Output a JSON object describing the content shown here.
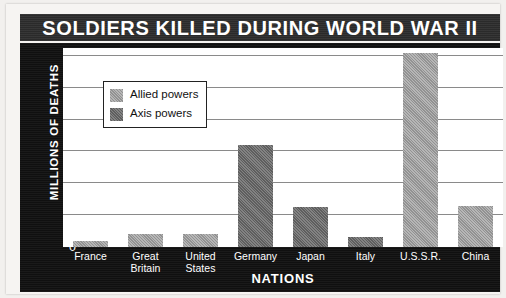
{
  "chart_data": {
    "type": "bar",
    "title": "SOLDIERS KILLED DURING WORLD WAR II",
    "xlabel": "NATIONS",
    "ylabel": "MILLIONS OF DEATHS",
    "categories": [
      "France",
      "Great Britain",
      "United States",
      "Germany",
      "Japan",
      "Italy",
      "U.S.S.R.",
      "China"
    ],
    "values": [
      0.2,
      0.4,
      0.4,
      3.2,
      1.25,
      0.33,
      6.1,
      1.3
    ],
    "groups": [
      "Allied powers",
      "Allied powers",
      "Allied powers",
      "Axis powers",
      "Axis powers",
      "Axis powers",
      "Allied powers",
      "Allied powers"
    ],
    "series": [
      {
        "name": "Allied powers",
        "color": "#9e9e9e",
        "points": [
          {
            "category": "France",
            "value": 0.2
          },
          {
            "category": "Great Britain",
            "value": 0.4
          },
          {
            "category": "United States",
            "value": 0.4
          },
          {
            "category": "U.S.S.R.",
            "value": 6.1
          },
          {
            "category": "China",
            "value": 1.3
          }
        ]
      },
      {
        "name": "Axis powers",
        "color": "#6b6b6b",
        "points": [
          {
            "category": "Germany",
            "value": 3.2
          },
          {
            "category": "Japan",
            "value": 1.25
          },
          {
            "category": "Italy",
            "value": 0.33
          }
        ]
      }
    ],
    "ylim": [
      0,
      6.25
    ],
    "yticks": [
      0,
      1,
      2,
      3,
      4,
      5,
      6
    ],
    "ytick_labels": [
      "0",
      "1",
      "2",
      "3",
      "4",
      "5",
      "6"
    ],
    "grid": true,
    "legend_position": "upper-left-inside"
  },
  "legend": {
    "entries": [
      {
        "label": "Allied powers",
        "swatch": "allied",
        "color": "#9e9e9e"
      },
      {
        "label": "Axis powers",
        "swatch": "axis",
        "color": "#6b6b6b"
      }
    ]
  },
  "colors": {
    "title_bar_background": "#2c2c2c",
    "title_text": "#ffffff",
    "frame_background": "#111111",
    "plot_background": "#ffffff",
    "gridline": "#8a8a8a",
    "allied_bar": "#9e9e9e",
    "axis_bar": "#6b6b6b"
  }
}
